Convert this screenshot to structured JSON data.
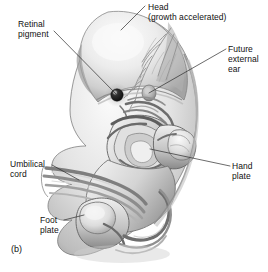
{
  "figure": {
    "panel_label": "(b)",
    "background_color": "#ffffff",
    "ink_color": "#111111",
    "leader_line_color": "#2b2b2b"
  },
  "annotations": [
    {
      "id": "retinal-pigment",
      "lines": [
        "Retinal",
        "pigment"
      ],
      "line1": "Retinal",
      "line2": "pigment",
      "points_to": "pigmented retina of developing eye",
      "leader": {
        "x1": 54,
        "y1": 31,
        "x2": 116,
        "y2": 94
      }
    },
    {
      "id": "head",
      "lines": [
        "Head",
        "(growth accelerated)"
      ],
      "line1": "Head",
      "line2": "(growth accelerated)",
      "points_to": "cranial dome",
      "leader": {
        "x1": 145,
        "y1": 6,
        "x2": 121,
        "y2": 30
      }
    },
    {
      "id": "future-external-ear",
      "lines": [
        "Future",
        "external",
        "ear"
      ],
      "line1": "Future",
      "line2": "external",
      "line3": "ear",
      "points_to": "auricular hillocks / otic primordium",
      "leader": {
        "x1": 226,
        "y1": 49,
        "x2": 149,
        "y2": 93
      }
    },
    {
      "id": "hand-plate",
      "lines": [
        "Hand",
        "plate"
      ],
      "line1": "Hand",
      "line2": "plate",
      "points_to": "distal upper limb bud",
      "leader": {
        "x1": 230,
        "y1": 166,
        "x2": 150,
        "y2": 149
      }
    },
    {
      "id": "umbilical-cord",
      "lines": [
        "Umbilical",
        "cord"
      ],
      "line1": "Umbilical",
      "line2": "cord",
      "points_to": "umbilical cord vessels",
      "leader": {
        "x1": 52,
        "y1": 165,
        "x2": 79,
        "y2": 180
      }
    },
    {
      "id": "foot-plate",
      "lines": [
        "Foot",
        "plate"
      ],
      "line1": "Foot",
      "line2": "plate",
      "points_to": "distal lower limb bud",
      "leader": {
        "x1": 64,
        "y1": 220,
        "x2": 84,
        "y2": 215
      }
    }
  ],
  "colors": {
    "background": "#ffffff",
    "text": "#111111",
    "leader": "#2b2b2b",
    "body_light": "#f2f2f2",
    "body_mid": "#c8c8c8",
    "body_shadow": "#8d8d8d",
    "body_dark": "#5a5a5a",
    "outline": "#4a4a4a",
    "eye_spot": "#1c1c1c"
  }
}
